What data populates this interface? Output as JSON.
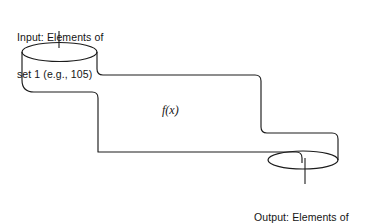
{
  "figure": {
    "stroke_color": "#1c1c1c",
    "fill_color": "#ffffff",
    "background_color": "#ffffff",
    "input_label": {
      "line1": "Input: Elements of",
      "line2": "set 1 (e.g., 105)"
    },
    "output_label": {
      "line1": "Output: Elements of",
      "line2": "set 2 (e.g., 610)"
    },
    "function_label": "f(x)",
    "parts": {
      "input_cylinder": "input-cylinder",
      "output_cylinder": "output-cylinder",
      "pipe": "pipe-body",
      "input_leader": "input-leader-line",
      "output_leader": "output-leader-line"
    }
  }
}
